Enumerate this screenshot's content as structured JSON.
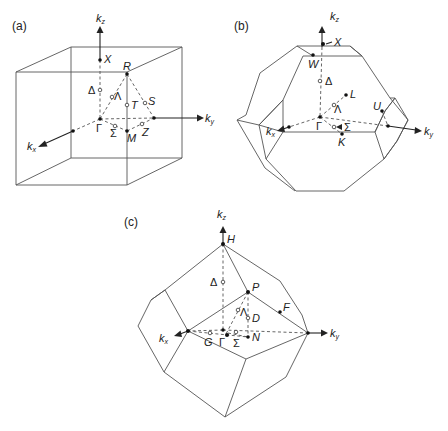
{
  "figure": {
    "panels": [
      {
        "id": "a",
        "label": "(a)",
        "lattice": "simple cubic Brillouin zone",
        "axes": {
          "kz": "k",
          "kz_sub": "z",
          "ky": "k",
          "ky_sub": "y",
          "kx": "k",
          "kx_sub": "x"
        },
        "points": {
          "X": "X",
          "R": "R",
          "Delta": "Δ",
          "Lambda": "Λ",
          "T": "T",
          "S": "S",
          "Gamma": "Γ",
          "Sigma": "Σ",
          "M": "M",
          "Z": "Z"
        }
      },
      {
        "id": "b",
        "label": "(b)",
        "lattice": "face-centered cubic Brillouin zone (truncated octahedron)",
        "axes": {
          "kz": "k",
          "kz_sub": "z",
          "ky": "k",
          "ky_sub": "y",
          "kx": "k",
          "kx_sub": "x"
        },
        "points": {
          "X": "X",
          "W": "W",
          "Delta": "Δ",
          "L": "L",
          "Lambda": "Λ",
          "U": "U",
          "Gamma": "Γ",
          "Sigma": "Σ",
          "K": "K"
        }
      },
      {
        "id": "c",
        "label": "(c)",
        "lattice": "body-centered cubic Brillouin zone (rhombic dodecahedron)",
        "axes": {
          "kz": "k",
          "kz_sub": "z",
          "ky": "k",
          "ky_sub": "y",
          "kx": "k",
          "kx_sub": "x"
        },
        "points": {
          "H": "H",
          "Delta": "Δ",
          "P": "P",
          "F": "F",
          "Lambda": "Λ",
          "D": "D",
          "N": "N",
          "G": "G",
          "Gamma": "Γ",
          "Sigma": "Σ"
        }
      }
    ]
  }
}
